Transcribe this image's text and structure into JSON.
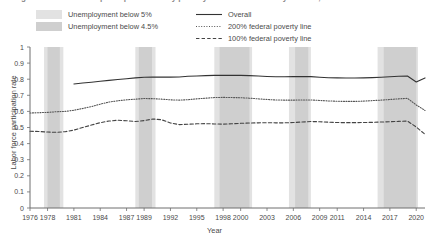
{
  "figure": {
    "title": "Figure 10. Labor force participation rate by poverty status for 25- to 54-year-olds, 1976-2021"
  },
  "legend": {
    "shading": [
      {
        "label": "Unemployment below 5%",
        "color": "#e2e2e2",
        "key": "light-gray-swatch"
      },
      {
        "label": "Unemployment below 4.5%",
        "color": "#cfcfcf",
        "key": "dark-gray-swatch"
      }
    ],
    "lines": [
      {
        "label": "Overall",
        "style": "solid",
        "key": "solid-line-key"
      },
      {
        "label": "200% federal poverty line",
        "style": "dotted",
        "key": "dotted-line-key"
      },
      {
        "label": "100% federal poverty line",
        "style": "dashed",
        "key": "dashed-line-key"
      }
    ]
  },
  "chart_data": {
    "type": "line",
    "title": "Figure 10. Labor force participation rate by poverty status for 25- to 54-year-olds, 1976-2021",
    "xlabel": "Year",
    "ylabel": "Labor force participation rate",
    "xlim": [
      1976,
      2021
    ],
    "ylim": [
      0,
      1
    ],
    "grid": false,
    "legend_position": "above-plot",
    "yticks": [
      "0",
      "0.1",
      "0.2",
      "0.3",
      "0.4",
      "0.5",
      "0.6",
      "0.7",
      "0.8",
      "0.9",
      "1"
    ],
    "ytick_values": [
      0,
      0.1,
      0.2,
      0.3,
      0.4,
      0.5,
      0.6,
      0.7,
      0.8,
      0.9,
      1
    ],
    "xticks": [
      "1976",
      "1978",
      "1981",
      "1984",
      "1987",
      "1989",
      "1992",
      "1995",
      "1998",
      "2000",
      "2003",
      "2006",
      "2009",
      "2011",
      "2014",
      "2017",
      "2020"
    ],
    "xtick_values": [
      1976,
      1978,
      1981,
      1984,
      1987,
      1989,
      1992,
      1995,
      1998,
      2000,
      2003,
      2006,
      2009,
      2011,
      2014,
      2017,
      2020
    ],
    "shaded_bands": [
      {
        "name": "Unemployment below 5%",
        "start": 1977.6,
        "end": 1979.8,
        "color": "#e2e2e2"
      },
      {
        "name": "Unemployment below 4.5%",
        "start": 1978.0,
        "end": 1979.4,
        "color": "#cfcfcf"
      },
      {
        "name": "Unemployment below 5%",
        "start": 1988.0,
        "end": 1990.3,
        "color": "#e2e2e2"
      },
      {
        "name": "Unemployment below 4.5%",
        "start": 1988.4,
        "end": 1989.9,
        "color": "#cfcfcf"
      },
      {
        "name": "Unemployment below 5%",
        "start": 1997.0,
        "end": 2001.3,
        "color": "#e2e2e2"
      },
      {
        "name": "Unemployment below 4.5%",
        "start": 1997.6,
        "end": 2001.0,
        "color": "#cfcfcf"
      },
      {
        "name": "Unemployment below 5%",
        "start": 2005.5,
        "end": 2008.0,
        "color": "#e2e2e2"
      },
      {
        "name": "Unemployment below 4.5%",
        "start": 2006.2,
        "end": 2007.7,
        "color": "#cfcfcf"
      },
      {
        "name": "Unemployment below 5%",
        "start": 2015.6,
        "end": 2020.2,
        "color": "#e2e2e2"
      },
      {
        "name": "Unemployment below 4.5%",
        "start": 2016.3,
        "end": 2020.0,
        "color": "#cfcfcf"
      }
    ],
    "series": [
      {
        "name": "Overall",
        "style": "solid",
        "color": "#333333",
        "x": [
          1981,
          1982,
          1983,
          1984,
          1985,
          1986,
          1987,
          1988,
          1989,
          1990,
          1991,
          1992,
          1993,
          1994,
          1995,
          1996,
          1997,
          1998,
          1999,
          2000,
          2001,
          2002,
          2003,
          2004,
          2005,
          2006,
          2007,
          2008,
          2009,
          2010,
          2011,
          2012,
          2013,
          2014,
          2015,
          2016,
          2017,
          2018,
          2019,
          2020,
          2021
        ],
        "y": [
          0.77,
          0.776,
          0.781,
          0.787,
          0.793,
          0.798,
          0.803,
          0.808,
          0.812,
          0.814,
          0.813,
          0.813,
          0.814,
          0.818,
          0.82,
          0.822,
          0.824,
          0.825,
          0.824,
          0.824,
          0.822,
          0.82,
          0.817,
          0.815,
          0.815,
          0.816,
          0.816,
          0.816,
          0.812,
          0.809,
          0.808,
          0.807,
          0.807,
          0.808,
          0.81,
          0.812,
          0.815,
          0.818,
          0.82,
          0.783,
          0.808
        ]
      },
      {
        "name": "200% federal poverty line",
        "style": "dotted",
        "color": "#555555",
        "x": [
          1976,
          1977,
          1978,
          1979,
          1980,
          1981,
          1982,
          1983,
          1984,
          1985,
          1986,
          1987,
          1988,
          1989,
          1990,
          1991,
          1992,
          1993,
          1994,
          1995,
          1996,
          1997,
          1998,
          1999,
          2000,
          2001,
          2002,
          2003,
          2004,
          2005,
          2006,
          2007,
          2008,
          2009,
          2010,
          2011,
          2012,
          2013,
          2014,
          2015,
          2016,
          2017,
          2018,
          2019,
          2020,
          2021
        ],
        "y": [
          0.59,
          0.592,
          0.594,
          0.598,
          0.6,
          0.607,
          0.618,
          0.63,
          0.645,
          0.658,
          0.666,
          0.672,
          0.676,
          0.68,
          0.679,
          0.676,
          0.672,
          0.67,
          0.673,
          0.678,
          0.682,
          0.686,
          0.687,
          0.686,
          0.685,
          0.682,
          0.678,
          0.674,
          0.671,
          0.67,
          0.67,
          0.671,
          0.671,
          0.668,
          0.665,
          0.663,
          0.662,
          0.662,
          0.664,
          0.667,
          0.67,
          0.674,
          0.678,
          0.681,
          0.64,
          0.606
        ]
      },
      {
        "name": "100% federal poverty line",
        "style": "dashed",
        "color": "#444444",
        "x": [
          1976,
          1977,
          1978,
          1979,
          1980,
          1981,
          1982,
          1983,
          1984,
          1985,
          1986,
          1987,
          1988,
          1989,
          1990,
          1991,
          1992,
          1993,
          1994,
          1995,
          1996,
          1997,
          1998,
          1999,
          2000,
          2001,
          2002,
          2003,
          2004,
          2005,
          2006,
          2007,
          2008,
          2009,
          2010,
          2011,
          2012,
          2013,
          2014,
          2015,
          2016,
          2017,
          2018,
          2019,
          2020,
          2021
        ],
        "y": [
          0.477,
          0.475,
          0.472,
          0.47,
          0.474,
          0.484,
          0.5,
          0.515,
          0.53,
          0.54,
          0.545,
          0.542,
          0.537,
          0.543,
          0.553,
          0.548,
          0.528,
          0.518,
          0.52,
          0.523,
          0.524,
          0.522,
          0.521,
          0.523,
          0.526,
          0.528,
          0.529,
          0.53,
          0.529,
          0.529,
          0.531,
          0.534,
          0.537,
          0.536,
          0.533,
          0.531,
          0.53,
          0.53,
          0.531,
          0.532,
          0.534,
          0.536,
          0.538,
          0.54,
          0.503,
          0.458
        ]
      }
    ]
  }
}
